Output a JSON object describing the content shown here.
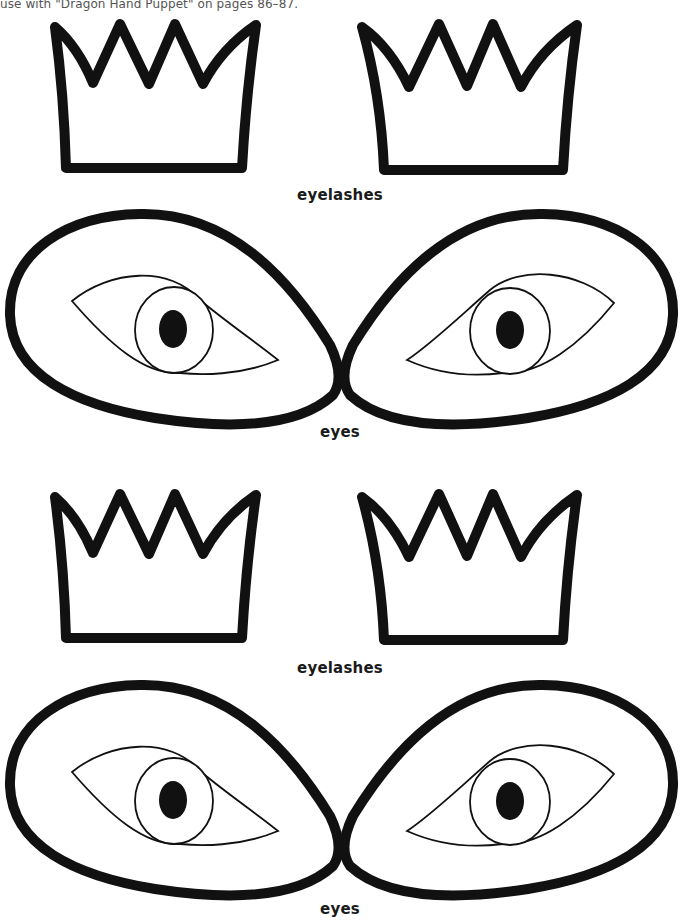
{
  "page": {
    "top_note": "use with \"Dragon Hand Puppet\" on pages 86–87.",
    "sections": [
      {
        "id": "eyelashes-1",
        "label": "eyelashes"
      },
      {
        "id": "eyes-1",
        "label": "eyes"
      },
      {
        "id": "eyelashes-2",
        "label": "eyelashes"
      },
      {
        "id": "eyes-2",
        "label": "eyes"
      }
    ]
  },
  "colors": {
    "ink": "#111111",
    "background": "#ffffff"
  }
}
